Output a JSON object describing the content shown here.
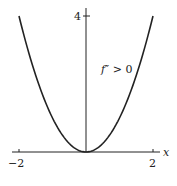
{
  "chart_data": {
    "type": "line",
    "title": "",
    "xlabel": "x",
    "ylabel": "",
    "xlim": [
      -2,
      2
    ],
    "ylim": [
      0,
      4
    ],
    "x_ticks": [
      "-2",
      "2"
    ],
    "y_ticks": [
      "4"
    ],
    "annotation": "f'' > 0",
    "series": [
      {
        "name": "f(x) = x^2",
        "x": [
          -2,
          -1.5,
          -1,
          -0.5,
          0,
          0.5,
          1,
          1.5,
          2
        ],
        "y": [
          4,
          2.25,
          1,
          0.25,
          0,
          0.25,
          1,
          2.25,
          4
        ]
      }
    ],
    "grid": false
  },
  "labels": {
    "x_min": "−2",
    "x_max": "2",
    "y_max": "4",
    "x_axis": "x",
    "annotation_f": "f",
    "annotation_rest": "″ > 0"
  }
}
